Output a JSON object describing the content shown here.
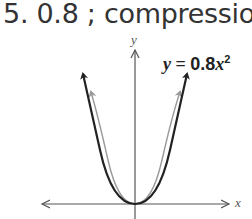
{
  "problem": {
    "number": "5.",
    "answer_value": "0.8",
    "separator": ";",
    "answer_type": "compression"
  },
  "graph": {
    "equation": {
      "var_y": "y",
      "equals": "=",
      "coefficient": "0.8",
      "var_x": "x",
      "exponent": "2"
    },
    "x_axis_label": "x",
    "y_axis_label": "y",
    "curves": [
      {
        "name": "y = 0.8x^2",
        "style": "dark",
        "color": "#222222"
      },
      {
        "name": "y = x^2 (parent)",
        "style": "light",
        "color": "#999999"
      }
    ]
  }
}
